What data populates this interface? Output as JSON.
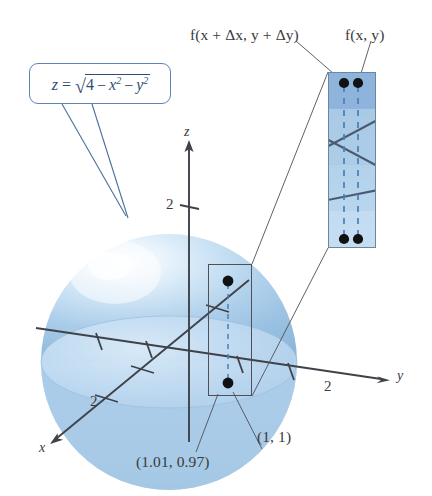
{
  "figure": {
    "background_color": "#ffffff"
  },
  "callout": {
    "name": "surface-equation-callout",
    "equation_plain": "z = √(4 − x² − y²)",
    "lhs": "z",
    "equals": "=",
    "radical": "√",
    "radicand_a": "4",
    "minus_1": "−",
    "x_var": "x",
    "x_exp": "2",
    "minus_2": "−",
    "y_var": "y",
    "y_exp": "2",
    "border_color": "#5b84b8",
    "text_color": "#2f4d72"
  },
  "inset": {
    "name": "magnified-detail-inset",
    "top_labels": [
      {
        "id": "f-incremented",
        "text": "f(x + Δx, y + Δy)"
      },
      {
        "id": "f-base",
        "text": "f(x, y)"
      }
    ],
    "fill_top_color": "#8fb4da",
    "fill_mid_color": "#b4d2ea",
    "fill_bottom_color": "#c3dbf0",
    "border_color": "#6a86a4",
    "dashed_line_color": "#4a7fb5",
    "dot_color": "#111114",
    "dot_pairs": 2
  },
  "surface": {
    "name": "hemisphere-surface",
    "shape": "hemisphere",
    "fill_light": "#eaf3fb",
    "fill_mid": "#bcd9ef",
    "fill_dark": "#a3c6e4",
    "base_ellipse_color": "#a9cbe8"
  },
  "axes": {
    "color": "#3f4349",
    "items": [
      {
        "id": "z-axis",
        "label": "z",
        "tick_label": "2",
        "direction": "up"
      },
      {
        "id": "y-axis",
        "label": "y",
        "tick_label": "2",
        "direction": "right"
      },
      {
        "id": "x-axis",
        "label": "x",
        "tick_label": "2",
        "direction": "down-left"
      }
    ]
  },
  "point_labels": [
    {
      "id": "point-perturbed",
      "text": "(1.01, 0.97)"
    },
    {
      "id": "point-base",
      "text": "(1, 1)"
    }
  ]
}
